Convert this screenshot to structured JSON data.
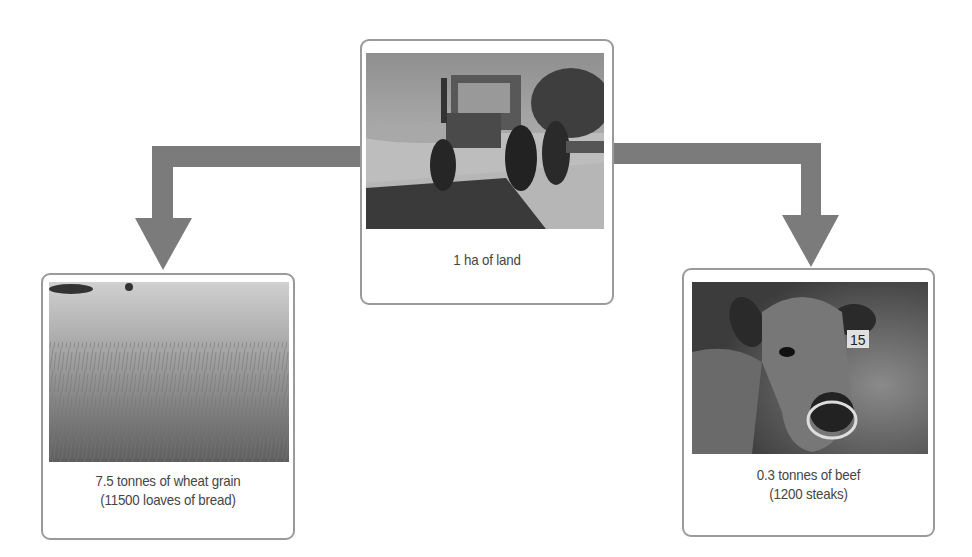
{
  "diagram": {
    "colors": {
      "arrow": "#7b7b7b",
      "border": "#9a9a9a",
      "text": "#454545"
    },
    "source": {
      "image_icon": "tractor-photo",
      "caption": "1 ha of land"
    },
    "outputs": [
      {
        "image_icon": "wheat-field-photo",
        "caption_line1": "7.5 tonnes of wheat grain",
        "caption_line2": "(11500 loaves of bread)"
      },
      {
        "image_icon": "cow-photo",
        "ear_tag": "15",
        "caption_line1": "0.3 tonnes of beef",
        "caption_line2": "(1200 steaks)"
      }
    ],
    "arrows": [
      {
        "from": "1 ha of land",
        "to": "7.5 tonnes of wheat grain"
      },
      {
        "from": "1 ha of land",
        "to": "0.3 tonnes of beef"
      }
    ]
  }
}
